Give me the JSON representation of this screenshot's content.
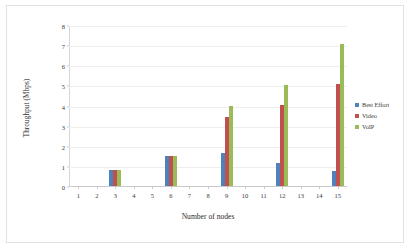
{
  "chart_data": {
    "type": "bar",
    "title": "",
    "xlabel": "Number of nodes",
    "ylabel": "Throughput (Mbps)",
    "categories": [
      "1",
      "2",
      "3",
      "4",
      "5",
      "6",
      "7",
      "8",
      "9",
      "10",
      "11",
      "12",
      "13",
      "14",
      "15"
    ],
    "xlim": [
      1,
      15
    ],
    "ylim": [
      0,
      8
    ],
    "yticks": [
      "0",
      "1",
      "2",
      "3",
      "4",
      "5",
      "6",
      "7",
      "8"
    ],
    "grid": true,
    "legend_position": "right",
    "series": [
      {
        "name": "Best Effort",
        "color": "#4F81BD",
        "values": [
          0,
          0,
          0.78,
          0,
          0,
          1.48,
          0,
          0,
          1.62,
          0,
          0,
          1.12,
          0,
          0,
          0.75
        ]
      },
      {
        "name": "Video",
        "color": "#C0504D",
        "values": [
          0,
          0,
          0.79,
          0,
          0,
          1.5,
          0,
          0,
          3.45,
          0,
          0,
          4.05,
          0,
          0,
          5.05
        ]
      },
      {
        "name": "VoIP",
        "color": "#9BBB59",
        "values": [
          0,
          0,
          0.8,
          0,
          0,
          1.5,
          0,
          0,
          4.0,
          0,
          0,
          5.0,
          0,
          0,
          7.05
        ]
      }
    ]
  },
  "legend": {
    "items": [
      {
        "label": "Best Effort",
        "color": "#4F81BD"
      },
      {
        "label": "Video",
        "color": "#C0504D"
      },
      {
        "label": "VoIP",
        "color": "#9BBB59"
      }
    ]
  },
  "axes": {
    "y_title": "Throughput (Mbps)",
    "x_title": "Number of nodes"
  }
}
